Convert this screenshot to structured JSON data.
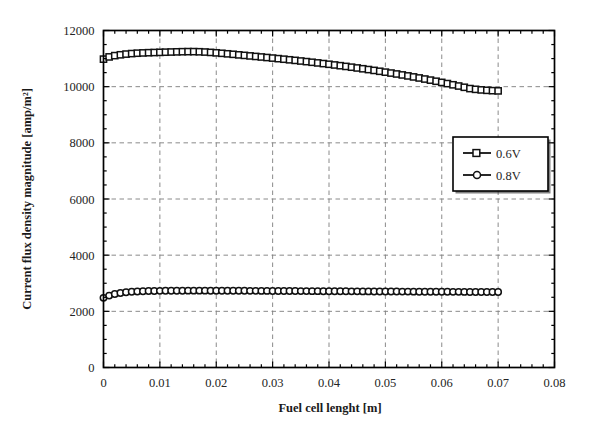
{
  "chart_data": {
    "type": "line",
    "title": "",
    "xlabel": "Fuel cell lenght [m]",
    "ylabel": "Current flux density magnitude [amp/m²]",
    "xlim": [
      0,
      0.08
    ],
    "ylim": [
      0,
      12000
    ],
    "xticks": [
      0,
      0.01,
      0.02,
      0.03,
      0.04,
      0.05,
      0.06,
      0.07,
      0.08
    ],
    "xtick_labels": [
      "0",
      "0.01",
      "0.02",
      "0.03",
      "0.04",
      "0.05",
      "0.06",
      "0.07",
      "0.08"
    ],
    "yticks": [
      0,
      2000,
      4000,
      6000,
      8000,
      10000,
      12000
    ],
    "ytick_labels": [
      "0",
      "2000",
      "4000",
      "6000",
      "8000",
      "10000",
      "12000"
    ],
    "grid": true,
    "grid_style": "dashed",
    "minor_ticks": true,
    "legend_position": "center-right",
    "series": [
      {
        "name": "0.6V",
        "marker": "square",
        "color": "#111111",
        "x": [
          0.0,
          0.001,
          0.002,
          0.003,
          0.004,
          0.005,
          0.006,
          0.007,
          0.008,
          0.009,
          0.01,
          0.011,
          0.012,
          0.013,
          0.014,
          0.015,
          0.016,
          0.017,
          0.018,
          0.019,
          0.02,
          0.021,
          0.022,
          0.023,
          0.024,
          0.025,
          0.026,
          0.027,
          0.028,
          0.029,
          0.03,
          0.031,
          0.032,
          0.033,
          0.034,
          0.035,
          0.036,
          0.037,
          0.038,
          0.039,
          0.04,
          0.041,
          0.042,
          0.043,
          0.044,
          0.045,
          0.046,
          0.047,
          0.048,
          0.049,
          0.05,
          0.051,
          0.052,
          0.053,
          0.054,
          0.055,
          0.056,
          0.057,
          0.058,
          0.059,
          0.06,
          0.061,
          0.062,
          0.063,
          0.064,
          0.065,
          0.066,
          0.067,
          0.068,
          0.069,
          0.07
        ],
        "y": [
          10980,
          11060,
          11105,
          11135,
          11160,
          11178,
          11192,
          11202,
          11210,
          11216,
          11222,
          11228,
          11234,
          11240,
          11245,
          11248,
          11248,
          11243,
          11233,
          11220,
          11205,
          11188,
          11170,
          11152,
          11133,
          11114,
          11095,
          11076,
          11057,
          11038,
          11018,
          10998,
          10978,
          10957,
          10936,
          10914,
          10892,
          10869,
          10846,
          10822,
          10798,
          10773,
          10747,
          10721,
          10694,
          10666,
          10638,
          10609,
          10579,
          10548,
          10517,
          10485,
          10452,
          10418,
          10383,
          10347,
          10310,
          10272,
          10233,
          10193,
          10152,
          10110,
          10067,
          10023,
          9978,
          9932,
          9905,
          9885,
          9870,
          9858,
          9850
        ]
      },
      {
        "name": "0.8V",
        "marker": "circle",
        "color": "#111111",
        "x": [
          0.0,
          0.001,
          0.002,
          0.003,
          0.004,
          0.005,
          0.006,
          0.007,
          0.008,
          0.009,
          0.01,
          0.011,
          0.012,
          0.013,
          0.014,
          0.015,
          0.016,
          0.017,
          0.018,
          0.019,
          0.02,
          0.021,
          0.022,
          0.023,
          0.024,
          0.025,
          0.026,
          0.027,
          0.028,
          0.029,
          0.03,
          0.031,
          0.032,
          0.033,
          0.034,
          0.035,
          0.036,
          0.037,
          0.038,
          0.039,
          0.04,
          0.041,
          0.042,
          0.043,
          0.044,
          0.045,
          0.046,
          0.047,
          0.048,
          0.049,
          0.05,
          0.051,
          0.052,
          0.053,
          0.054,
          0.055,
          0.056,
          0.057,
          0.058,
          0.059,
          0.06,
          0.061,
          0.062,
          0.063,
          0.064,
          0.065,
          0.066,
          0.067,
          0.068,
          0.069,
          0.07
        ],
        "y": [
          2480,
          2560,
          2615,
          2652,
          2678,
          2696,
          2708,
          2716,
          2722,
          2726,
          2729,
          2731,
          2733,
          2734,
          2735,
          2736,
          2736,
          2736,
          2736,
          2735,
          2735,
          2734,
          2734,
          2733,
          2732,
          2731,
          2730,
          2729,
          2728,
          2727,
          2726,
          2725,
          2724,
          2723,
          2722,
          2721,
          2720,
          2719,
          2718,
          2717,
          2716,
          2715,
          2714,
          2713,
          2712,
          2711,
          2710,
          2709,
          2708,
          2707,
          2706,
          2705,
          2704,
          2703,
          2702,
          2701,
          2700,
          2699,
          2698,
          2697,
          2696,
          2695,
          2694,
          2693,
          2692,
          2691,
          2690,
          2689,
          2688,
          2687,
          2686
        ]
      }
    ]
  },
  "legend": {
    "entries": [
      {
        "label": "0.6V",
        "marker": "square"
      },
      {
        "label": "0.8V",
        "marker": "circle"
      }
    ]
  },
  "axes": {
    "x_title": "Fuel cell lenght [m]",
    "y_title": "Current flux density magnitude [amp/m²]"
  }
}
